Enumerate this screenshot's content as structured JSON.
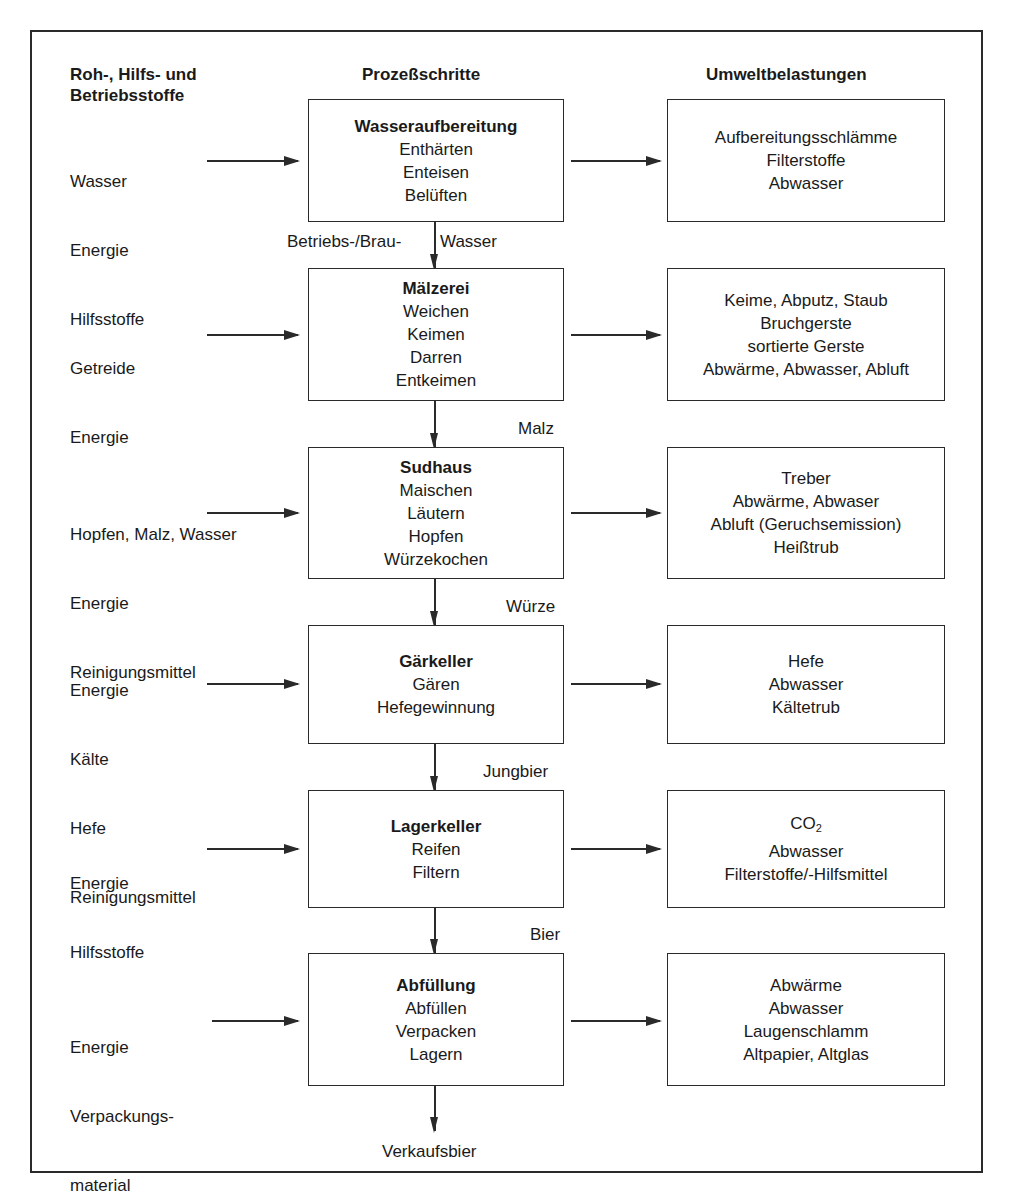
{
  "headers": {
    "inputs": "Roh-, Hilfs- und Betriebsstoffe",
    "inputs_line1": "Roh-, Hilfs- und",
    "inputs_line2": "Betriebsstoffe",
    "process": "Prozeßschritte",
    "emissions": "Umweltbelastungen"
  },
  "steps": [
    {
      "inputs": [
        "Wasser",
        "Energie",
        "Hilfsstoffe"
      ],
      "title": "Wasseraufbereitung",
      "operations": [
        "Enthärten",
        "Enteisen",
        "Belüften"
      ],
      "outputs": [
        "Aufbereitungsschlämme",
        "Filterstoffe",
        "Abwasser"
      ],
      "product": "Betriebs-/Brau- Wasser",
      "product_left": "Betriebs-/Brau-",
      "product_right": "Wasser"
    },
    {
      "inputs": [
        "Getreide",
        "Energie"
      ],
      "title": "Mälzerei",
      "operations": [
        "Weichen",
        "Keimen",
        "Darren",
        "Entkeimen"
      ],
      "outputs": [
        "Keime, Abputz, Staub",
        "Bruchgerste",
        "sortierte Gerste",
        "Abwärme, Abwasser, Abluft"
      ],
      "product": "Malz"
    },
    {
      "inputs": [
        "Hopfen, Malz, Wasser",
        "Energie",
        "Reinigungsmittel"
      ],
      "title": "Sudhaus",
      "operations": [
        "Maischen",
        "Läutern",
        "Hopfen",
        "Würzekochen"
      ],
      "outputs": [
        "Treber",
        "Abwärme, Abwaser",
        "Abluft (Geruchsemission)",
        "Heißtrub"
      ],
      "product": "Würze"
    },
    {
      "inputs": [
        "Energie",
        "Kälte",
        "Hefe",
        "Reinigungsmittel"
      ],
      "title": "Gärkeller",
      "operations": [
        "Gären",
        "Hefegewinnung"
      ],
      "outputs": [
        "Hefe",
        "Abwasser",
        "Kältetrub"
      ],
      "product": "Jungbier"
    },
    {
      "inputs": [
        "Energie",
        "Hilfsstoffe"
      ],
      "title": "Lagerkeller",
      "operations": [
        "Reifen",
        "Filtern"
      ],
      "outputs": [
        "CO2",
        "Abwasser",
        "Filterstoffe/-Hilfsmittel"
      ],
      "co2_base": "CO",
      "co2_sub": "2",
      "product": "Bier"
    },
    {
      "inputs": [
        "Energie",
        "Verpackungs-",
        "material"
      ],
      "title": "Abfüllung",
      "operations": [
        "Abfüllen",
        "Verpacken",
        "Lagern"
      ],
      "outputs": [
        "Abwärme",
        "Abwasser",
        "Laugenschlamm",
        "Altpapier, Altglas"
      ],
      "product": "Verkaufsbier"
    }
  ]
}
